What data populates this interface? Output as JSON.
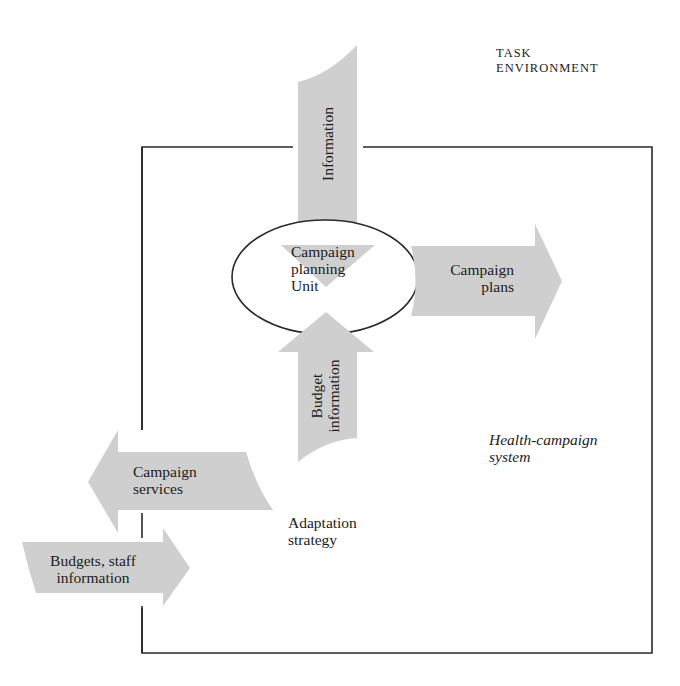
{
  "diagram": {
    "type": "systems-flow",
    "colors": {
      "arrow_fill": "#cfcfcf",
      "line": "#2a2a2a",
      "text": "#1c1c1c",
      "background": "#ffffff"
    },
    "environment_label": {
      "line1": "TASK",
      "line2": "ENVIRONMENT"
    },
    "system_label": {
      "line1": "Health-campaign",
      "line2": "system"
    },
    "center_node": {
      "line1": "Campaign",
      "line2": "planning",
      "line3": "Unit"
    },
    "arrows": {
      "information": {
        "label": "Information",
        "direction": "down"
      },
      "campaign_plans": {
        "line1": "Campaign",
        "line2": "plans",
        "direction": "right"
      },
      "budget_information": {
        "line1": "Budget",
        "line2": "information",
        "direction": "up"
      },
      "campaign_services": {
        "line1": "Campaign",
        "line2": "services",
        "direction": "left"
      },
      "budgets_staff": {
        "line1": "Budgets, staff",
        "line2": "information",
        "direction": "right"
      }
    },
    "adaptation_label": {
      "line1": "Adaptation",
      "line2": "strategy"
    }
  }
}
